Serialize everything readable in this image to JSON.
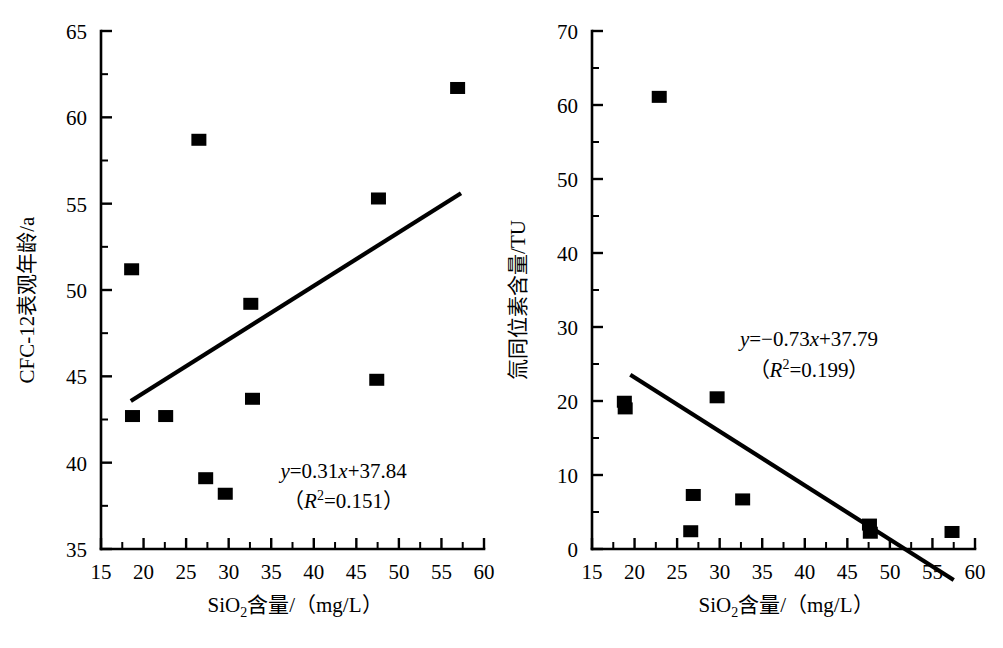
{
  "figure": {
    "background": "#ffffff",
    "ink": "#000000",
    "panel_count": 2
  },
  "chart_data": [
    {
      "type": "scatter",
      "panel": "left",
      "title": "",
      "xlabel": "SiO₂含量/(mg/L)",
      "ylabel": "CFC-12表观年龄/a",
      "xlabel_parts": {
        "prefix": "SiO",
        "subscript": "2",
        "suffix": "含量/（mg/L）"
      },
      "xlim": [
        15,
        60
      ],
      "ylim": [
        35,
        65
      ],
      "xticks": [
        15,
        20,
        25,
        30,
        35,
        40,
        45,
        50,
        55,
        60
      ],
      "yticks": [
        35,
        40,
        45,
        50,
        55,
        60,
        65
      ],
      "xtick_labels": [
        "15",
        "20",
        "25",
        "30",
        "35",
        "40",
        "45",
        "50",
        "55",
        "60"
      ],
      "ytick_labels": [
        "35",
        "40",
        "45",
        "50",
        "55",
        "60",
        "65"
      ],
      "minor_ticks_x": true,
      "minor_ticks_y": true,
      "grid": false,
      "legend": false,
      "marker": "filled-square",
      "points": [
        {
          "x": 18.6,
          "y": 51.2
        },
        {
          "x": 18.7,
          "y": 42.7
        },
        {
          "x": 22.6,
          "y": 42.7
        },
        {
          "x": 26.5,
          "y": 58.7
        },
        {
          "x": 27.3,
          "y": 39.1
        },
        {
          "x": 29.6,
          "y": 38.2
        },
        {
          "x": 32.6,
          "y": 49.2
        },
        {
          "x": 32.8,
          "y": 43.7
        },
        {
          "x": 47.4,
          "y": 44.8
        },
        {
          "x": 47.6,
          "y": 55.3
        },
        {
          "x": 56.9,
          "y": 61.7
        }
      ],
      "trendline": {
        "equation": "y=0.31x+37.84",
        "r2_label": "（R²=0.151）",
        "slope": 0.31,
        "intercept": 37.84,
        "r2": 0.151,
        "x_start": 18.5,
        "x_end": 57.3,
        "eq_lines": [
          {
            "lead_it": "y",
            "rest": "=0.31",
            "mid_it": "x",
            "tail": "+37.84"
          },
          {
            "paren_open": "（",
            "r_it": "R",
            "sup": "2",
            "rest2": "=0.151",
            "paren_close": "）"
          }
        ],
        "annotation_x": 43.5,
        "annotation_y_line1": 39.1,
        "annotation_y_line2": 37.4
      }
    },
    {
      "type": "scatter",
      "panel": "right",
      "title": "",
      "xlabel": "SiO₂含量/(mg/L)",
      "ylabel": "氚同位素含量/TU",
      "xlabel_parts": {
        "prefix": "SiO",
        "subscript": "2",
        "suffix": "含量/（mg/L）"
      },
      "xlim": [
        15,
        60
      ],
      "ylim": [
        0,
        70
      ],
      "xticks": [
        15,
        20,
        25,
        30,
        35,
        40,
        45,
        50,
        55,
        60
      ],
      "yticks": [
        0,
        10,
        20,
        30,
        40,
        50,
        60,
        70
      ],
      "xtick_labels": [
        "15",
        "20",
        "25",
        "30",
        "35",
        "40",
        "45",
        "50",
        "55",
        "60"
      ],
      "ytick_labels": [
        "0",
        "10",
        "20",
        "30",
        "40",
        "50",
        "60",
        "70"
      ],
      "minor_ticks_x": true,
      "minor_ticks_y": true,
      "grid": false,
      "legend": false,
      "marker": "filled-square",
      "points": [
        {
          "x": 22.9,
          "y": 61.1
        },
        {
          "x": 18.8,
          "y": 19.9
        },
        {
          "x": 18.9,
          "y": 19.0
        },
        {
          "x": 29.7,
          "y": 20.5
        },
        {
          "x": 26.9,
          "y": 7.3
        },
        {
          "x": 32.7,
          "y": 6.7
        },
        {
          "x": 26.6,
          "y": 2.4
        },
        {
          "x": 47.6,
          "y": 3.3
        },
        {
          "x": 47.7,
          "y": 2.2
        },
        {
          "x": 57.3,
          "y": 2.3
        }
      ],
      "trendline": {
        "equation": "y=−0.73x+37.79",
        "r2_label": "（R²=0.199）",
        "slope": -0.73,
        "intercept": 37.79,
        "r2": 0.199,
        "x_start": 19.5,
        "x_end": 57.5,
        "eq_lines": [
          {
            "lead_it": "y",
            "rest": "=−0.73",
            "mid_it": "x",
            "tail": "+37.79"
          },
          {
            "paren_open": "（",
            "r_it": "R",
            "sup": "2",
            "rest2": "=0.199",
            "paren_close": "）"
          }
        ],
        "annotation_x": 40.5,
        "annotation_y_line1": 27.5,
        "annotation_y_line2": 23.3
      }
    }
  ]
}
